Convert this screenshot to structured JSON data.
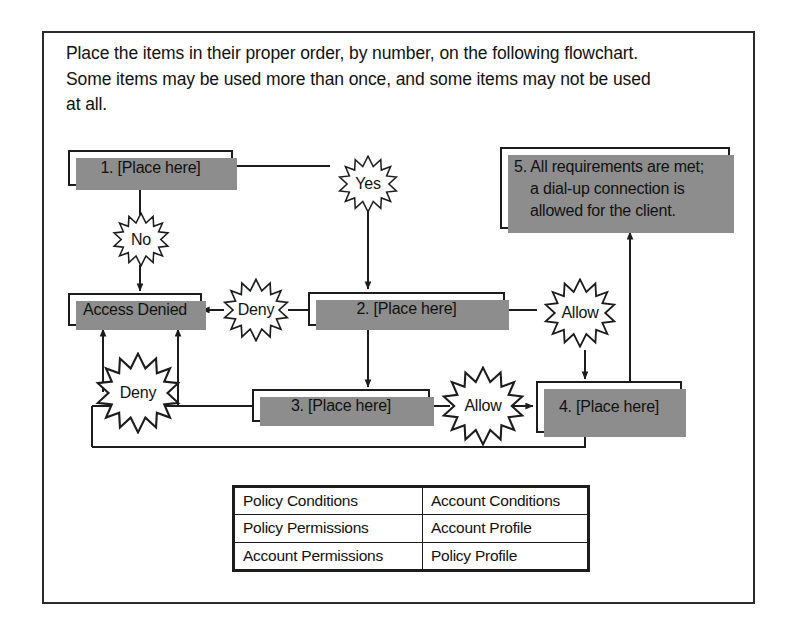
{
  "instructions": {
    "line1": "Place the items in their proper order, by number, on the following flowchart.",
    "line2": "Some items may be used more than once, and some items may not be used",
    "line3": "at all."
  },
  "flowchart": {
    "boxes": [
      {
        "id": "box1",
        "label": "1. [Place here]"
      },
      {
        "id": "access-denied",
        "label": "Access Denied"
      },
      {
        "id": "box2",
        "label": "2. [Place here]"
      },
      {
        "id": "box3",
        "label": "3. [Place here]"
      },
      {
        "id": "box4",
        "label": "4. [Place here]"
      }
    ],
    "box5": {
      "line1": "5. All requirements are met;",
      "line2": "a dial-up connection is",
      "line3": "allowed for the client."
    },
    "decision_labels": [
      {
        "id": "yes-star",
        "label": "Yes"
      },
      {
        "id": "no-star",
        "label": "No"
      },
      {
        "id": "deny-star-1",
        "label": "Deny"
      },
      {
        "id": "deny-star-2",
        "label": "Deny"
      },
      {
        "id": "allow-star-1",
        "label": "Allow"
      },
      {
        "id": "allow-star-2",
        "label": "Allow"
      }
    ]
  },
  "answer_bank": {
    "rows": [
      [
        "Policy Conditions",
        "Account Conditions"
      ],
      [
        "Policy Permissions",
        "Account Profile"
      ],
      [
        "Account Permissions",
        "Policy Profile"
      ]
    ]
  },
  "colors": {
    "ink": "#111111",
    "line": "#1c1c1c",
    "shadow": "#8d8d8d",
    "paper": "#ffffff"
  }
}
